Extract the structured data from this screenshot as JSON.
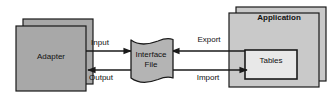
{
  "diagram": {
    "type": "flow-diagram",
    "background_color": "#ffffff",
    "palette": {
      "node_fill": "#a8a8a8",
      "node_fill_light": "#c9c9c9",
      "inner_fill": "#e8e8e8",
      "stroke": "#1a1a1a",
      "text": "#111111"
    },
    "nodes": [
      {
        "id": "adapter",
        "label": "Adapter",
        "shape": "stacked-rectangle",
        "bold": false,
        "fill": "#a8a8a8"
      },
      {
        "id": "interface-file",
        "label_line1": "Interface",
        "label_line2": "File",
        "shape": "document-wave",
        "bold": false,
        "fill": "#b4b4b4"
      },
      {
        "id": "application",
        "label": "Application",
        "shape": "stacked-rectangle",
        "bold": true,
        "fill": "#c9c9c9"
      },
      {
        "id": "tables",
        "label": "Tables",
        "shape": "rectangle",
        "bold": false,
        "fill": "#e8e8e8",
        "parent": "application"
      }
    ],
    "edges": [
      {
        "id": "input",
        "label": "Input",
        "from": "adapter",
        "to": "interface-file",
        "direction": "right"
      },
      {
        "id": "output",
        "label": "Output",
        "from": "interface-file",
        "to": "adapter",
        "direction": "left"
      },
      {
        "id": "export",
        "label": "Export",
        "from": "tables",
        "to": "interface-file",
        "direction": "left"
      },
      {
        "id": "import",
        "label": "Import",
        "from": "interface-file",
        "to": "tables",
        "direction": "right"
      }
    ]
  }
}
